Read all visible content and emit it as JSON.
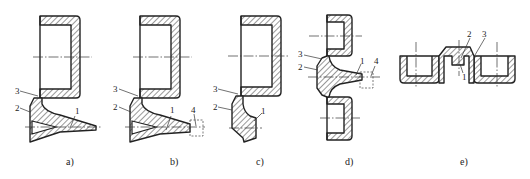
{
  "figure": {
    "panels": [
      {
        "id": "a",
        "caption": "a)",
        "callouts": [
          "1",
          "2",
          "3"
        ]
      },
      {
        "id": "b",
        "caption": "b)",
        "callouts": [
          "1",
          "2",
          "3",
          "4"
        ]
      },
      {
        "id": "c",
        "caption": "c)",
        "callouts": [
          "1",
          "2",
          "3"
        ]
      },
      {
        "id": "d",
        "caption": "d)",
        "callouts": [
          "1",
          "2",
          "3",
          "4"
        ]
      },
      {
        "id": "e",
        "caption": "e)",
        "callouts": [
          "1",
          "2",
          "3"
        ]
      }
    ]
  },
  "colors": {
    "line": "#222222",
    "background": "#ffffff"
  }
}
